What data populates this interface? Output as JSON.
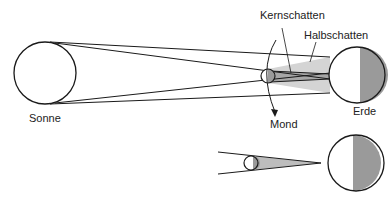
{
  "diagram": {
    "labels": {
      "sun": "Sonne",
      "earth": "Erde",
      "moon": "Mond",
      "umbra": "Kernschatten",
      "penumbra": "Halbschatten"
    },
    "colors": {
      "stroke": "#1a1a1a",
      "shadow_dark": "#a6a6a6",
      "shadow_light": "#d4d4d4",
      "night_side": "#9a9a9a",
      "background": "#ffffff"
    },
    "bodies": {
      "sun": {
        "cx": 45,
        "cy": 73,
        "r": 31
      },
      "moon_top": {
        "cx": 268,
        "cy": 76,
        "r": 7
      },
      "earth_top": {
        "cx": 357,
        "cy": 75,
        "r": 28
      },
      "moon_bottom": {
        "cx": 251,
        "cy": 163,
        "r": 7
      },
      "earth_bottom": {
        "cx": 356,
        "cy": 163,
        "r": 28
      }
    }
  }
}
